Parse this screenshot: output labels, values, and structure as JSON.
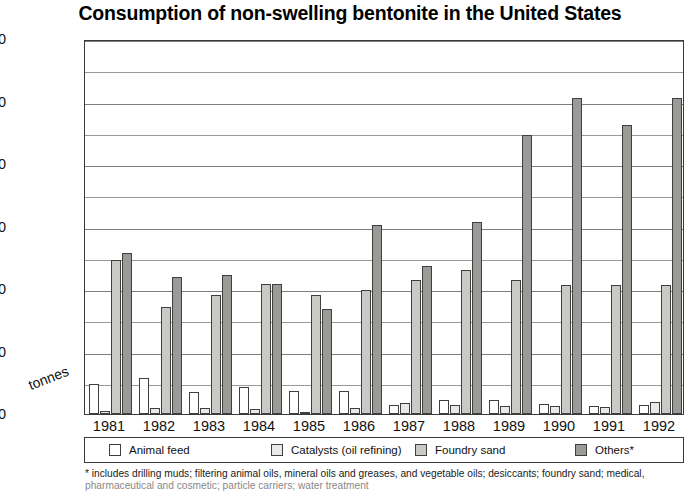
{
  "chart_data": {
    "type": "bar",
    "title": "Consumption of non-swelling bentonite in the United States",
    "xlabel": "",
    "ylabel": "tonnes",
    "ylim": [
      0,
      600000
    ],
    "ytick_step": 100000,
    "minor_gridline_step": 50000,
    "grid": true,
    "legend_position": "bottom",
    "ytick_labels": [
      "600,000",
      "500,000",
      "400,000",
      "300,000",
      "200,000",
      "100,000",
      "0"
    ],
    "ytick_values": [
      600000,
      500000,
      400000,
      300000,
      200000,
      100000,
      0
    ],
    "categories": [
      "1981",
      "1982",
      "1983",
      "1984",
      "1985",
      "1986",
      "1987",
      "1988",
      "1989",
      "1990",
      "1991",
      "1992"
    ],
    "series": [
      {
        "name": "Animal feed",
        "color": "#ffffff",
        "values": [
          48000,
          57000,
          35000,
          44000,
          37000,
          37000,
          14000,
          22000,
          22000,
          16000,
          13000,
          15000
        ]
      },
      {
        "name": "Catalysts (oil refining)",
        "color": "#e9e9e7",
        "values": [
          5000,
          9000,
          10000,
          8000,
          3000,
          9000,
          17000,
          14000,
          13000,
          13000,
          11000,
          19000
        ]
      },
      {
        "name": "Foundry sand",
        "color": "#c9c9c5",
        "values": [
          247000,
          171000,
          190000,
          208000,
          190000,
          199000,
          214000,
          231000,
          214000,
          206000,
          206000,
          207000
        ]
      },
      {
        "name": "Others*",
        "color": "#9a9a96",
        "values": [
          258000,
          219000,
          223000,
          208000,
          168000,
          303000,
          237000,
          307000,
          447000,
          506000,
          463000,
          505000
        ]
      }
    ],
    "footnote_line1": "* includes drilling muds; filtering animal oils, mineral oils and greases, and vegetable oils; desiccants; foundry sand; medical,",
    "footnote_line2": "pharmaceutical and cosmetic; particle carriers; water treatment"
  }
}
